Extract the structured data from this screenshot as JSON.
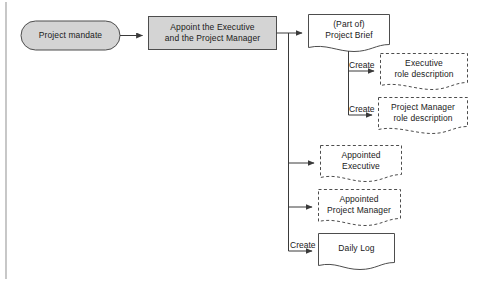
{
  "diagram": {
    "colors": {
      "process_fill": "#d4d4d4",
      "stroke": "#4d4d4d",
      "text": "#1a1a1a",
      "frame_line": "#9a9a9a"
    },
    "nodes": [
      {
        "id": "project-mandate",
        "shape": "rounded-rectangle",
        "style": "filled-solid",
        "lines": [
          "Project mandate"
        ]
      },
      {
        "id": "appoint-executive-and-project-manager",
        "shape": "rectangle",
        "style": "filled-solid",
        "lines": [
          "Appoint the Executive",
          "and the Project Manager"
        ]
      },
      {
        "id": "project-brief",
        "shape": "document",
        "style": "solid",
        "lines": [
          "(Part of)",
          "Project Brief"
        ]
      },
      {
        "id": "executive-role-description",
        "shape": "document",
        "style": "dashed",
        "lines": [
          "Executive",
          "role description"
        ]
      },
      {
        "id": "project-manager-role-description",
        "shape": "document",
        "style": "dashed",
        "lines": [
          "Project Manager",
          "role description"
        ]
      },
      {
        "id": "appointed-executive",
        "shape": "document",
        "style": "dashed",
        "lines": [
          "Appointed",
          "Executive"
        ]
      },
      {
        "id": "appointed-project-manager",
        "shape": "document",
        "style": "dashed",
        "lines": [
          "Appointed",
          "Project Manager"
        ]
      },
      {
        "id": "daily-log",
        "shape": "document",
        "style": "solid",
        "lines": [
          "Daily Log"
        ]
      }
    ],
    "edge_labels": [
      {
        "id": "create-executive-role-description",
        "text": "Create"
      },
      {
        "id": "create-project-manager-role-description",
        "text": "Create"
      },
      {
        "id": "create-daily-log",
        "text": "Create"
      }
    ]
  }
}
